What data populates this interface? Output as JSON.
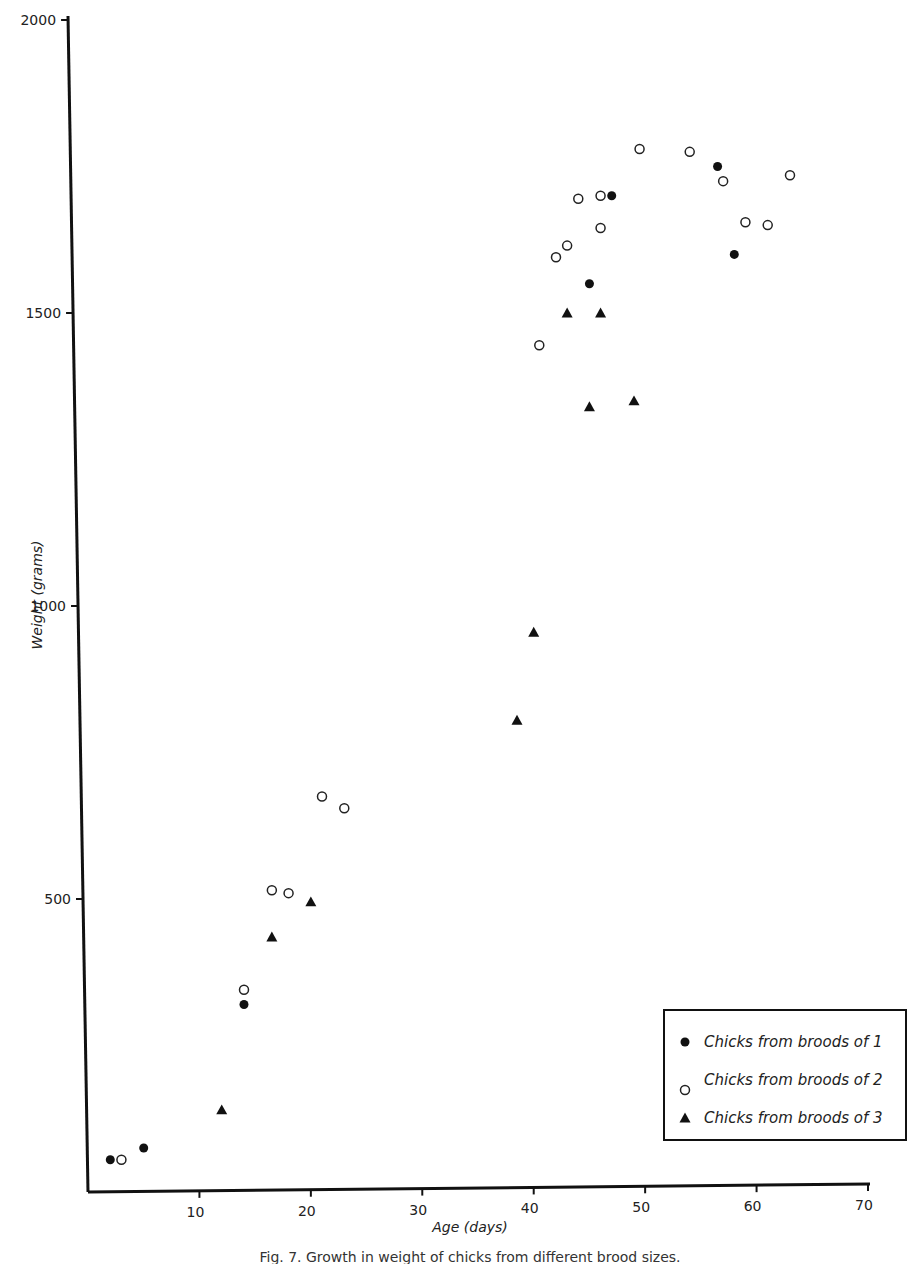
{
  "chart_data": {
    "type": "scatter",
    "title": "",
    "xlabel": "Age (days)",
    "ylabel": "Weight (grams)",
    "xlim": [
      0,
      70
    ],
    "ylim": [
      0,
      2000
    ],
    "x_ticks": [
      10,
      20,
      30,
      40,
      50,
      60,
      70
    ],
    "y_ticks": [
      500,
      1000,
      1500,
      2000
    ],
    "x_tick_labels": [
      "10",
      "20",
      "30",
      "40",
      "50",
      "60",
      "70"
    ],
    "y_tick_labels": [
      "500",
      "1000",
      "1500",
      "2000"
    ],
    "grid": false,
    "legend_position": "bottom-right",
    "series": [
      {
        "name": "Chicks from broods of 1",
        "marker": "filled-circle",
        "points": [
          {
            "x": 2,
            "y": 55
          },
          {
            "x": 5,
            "y": 75
          },
          {
            "x": 14,
            "y": 320
          },
          {
            "x": 45,
            "y": 1550
          },
          {
            "x": 47,
            "y": 1700
          },
          {
            "x": 56.5,
            "y": 1750
          },
          {
            "x": 58,
            "y": 1600
          }
        ]
      },
      {
        "name": "Chicks from broods of 2",
        "marker": "open-circle",
        "points": [
          {
            "x": 3,
            "y": 55
          },
          {
            "x": 14,
            "y": 345
          },
          {
            "x": 16.5,
            "y": 515
          },
          {
            "x": 18,
            "y": 510
          },
          {
            "x": 21,
            "y": 675
          },
          {
            "x": 23,
            "y": 655
          },
          {
            "x": 40.5,
            "y": 1445
          },
          {
            "x": 42,
            "y": 1595
          },
          {
            "x": 43,
            "y": 1615
          },
          {
            "x": 44,
            "y": 1695
          },
          {
            "x": 46,
            "y": 1645
          },
          {
            "x": 46,
            "y": 1700
          },
          {
            "x": 49.5,
            "y": 1780
          },
          {
            "x": 54,
            "y": 1775
          },
          {
            "x": 57,
            "y": 1725
          },
          {
            "x": 59,
            "y": 1655
          },
          {
            "x": 61,
            "y": 1650
          },
          {
            "x": 63,
            "y": 1735
          }
        ]
      },
      {
        "name": "Chicks from broods of 3",
        "marker": "filled-triangle",
        "points": [
          {
            "x": 12,
            "y": 140
          },
          {
            "x": 16.5,
            "y": 435
          },
          {
            "x": 20,
            "y": 495
          },
          {
            "x": 38.5,
            "y": 805
          },
          {
            "x": 40,
            "y": 955
          },
          {
            "x": 43,
            "y": 1500
          },
          {
            "x": 45,
            "y": 1340
          },
          {
            "x": 46,
            "y": 1500
          },
          {
            "x": 49,
            "y": 1350
          }
        ]
      }
    ],
    "caption": "Fig. 7. Growth in weight of chicks from different brood sizes."
  }
}
